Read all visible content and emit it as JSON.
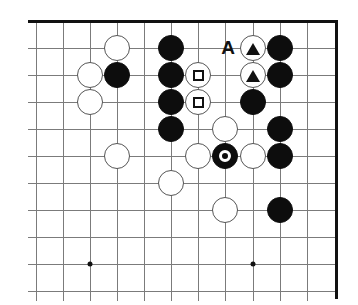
{
  "diagram": {
    "kind": "go-board-diagram",
    "board_region": "top-right corner",
    "columns": 11,
    "rows": 10,
    "cell_size_px": 27,
    "origin_x_px": 36,
    "origin_y_px": 21,
    "colors": {
      "background": "#ffffff",
      "grid_line": "#7b7b7b",
      "board_edge": "#111111",
      "black_stone": "#0d0d0d",
      "white_stone": "#ffffff",
      "white_stone_outline": "#555555",
      "marker": "#111111",
      "marker_on_black": "#ffffff"
    }
  },
  "edges": {
    "top": {
      "label": "top board edge",
      "y": 21,
      "x1": 28,
      "x2": 337
    },
    "right": {
      "label": "right board edge",
      "x": 335,
      "y1": 20,
      "y2": 299
    }
  },
  "grid": {
    "vertical_x": [
      36,
      63,
      90,
      117,
      144,
      171,
      198,
      225,
      253,
      280,
      307
    ],
    "horizontal_y": [
      21,
      48,
      75,
      102,
      129,
      156,
      183,
      210,
      237,
      264,
      291
    ]
  },
  "star_points": [
    {
      "name": "star-point-left",
      "x": 90,
      "y": 264
    },
    {
      "name": "star-point-right",
      "x": 253,
      "y": 264
    }
  ],
  "stones": [
    {
      "id": "w-c4-r2",
      "color": "white",
      "x": 117,
      "y": 48,
      "mark": null
    },
    {
      "id": "b-c6-r2",
      "color": "black",
      "x": 171,
      "y": 48,
      "mark": null
    },
    {
      "id": "w-c9-r2",
      "color": "white",
      "x": 253,
      "y": 48,
      "mark": "triangle"
    },
    {
      "id": "b-c10-r2",
      "color": "black",
      "x": 280,
      "y": 48,
      "mark": null
    },
    {
      "id": "w-c3-r3",
      "color": "white",
      "x": 90,
      "y": 75,
      "mark": null
    },
    {
      "id": "b-c4-r3",
      "color": "black",
      "x": 117,
      "y": 75,
      "mark": null
    },
    {
      "id": "b-c6-r3",
      "color": "black",
      "x": 171,
      "y": 75,
      "mark": null
    },
    {
      "id": "w-c7-r3",
      "color": "white",
      "x": 198,
      "y": 75,
      "mark": "square"
    },
    {
      "id": "w-c9-r3",
      "color": "white",
      "x": 253,
      "y": 75,
      "mark": "triangle"
    },
    {
      "id": "b-c10-r3",
      "color": "black",
      "x": 280,
      "y": 75,
      "mark": null
    },
    {
      "id": "w-c3-r4",
      "color": "white",
      "x": 90,
      "y": 102,
      "mark": null
    },
    {
      "id": "b-c6-r4",
      "color": "black",
      "x": 171,
      "y": 102,
      "mark": null
    },
    {
      "id": "w-c7-r4",
      "color": "white",
      "x": 198,
      "y": 102,
      "mark": "square"
    },
    {
      "id": "b-c9-r4",
      "color": "black",
      "x": 253,
      "y": 102,
      "mark": null
    },
    {
      "id": "b-c6-r5",
      "color": "black",
      "x": 171,
      "y": 129,
      "mark": null
    },
    {
      "id": "w-c8-r5",
      "color": "white",
      "x": 225,
      "y": 129,
      "mark": null
    },
    {
      "id": "b-c10-r5",
      "color": "black",
      "x": 280,
      "y": 129,
      "mark": null
    },
    {
      "id": "w-c4-r6",
      "color": "white",
      "x": 117,
      "y": 156,
      "mark": null
    },
    {
      "id": "w-c7-r6",
      "color": "white",
      "x": 198,
      "y": 156,
      "mark": null
    },
    {
      "id": "b-c8-r6",
      "color": "black",
      "x": 225,
      "y": 156,
      "mark": "circle"
    },
    {
      "id": "w-c9-r6",
      "color": "white",
      "x": 253,
      "y": 156,
      "mark": null
    },
    {
      "id": "b-c10-r6",
      "color": "black",
      "x": 280,
      "y": 156,
      "mark": null
    },
    {
      "id": "w-c6-r7",
      "color": "white",
      "x": 171,
      "y": 183,
      "mark": null
    },
    {
      "id": "w-c8-r8",
      "color": "white",
      "x": 225,
      "y": 210,
      "mark": null
    },
    {
      "id": "b-c10-r8",
      "color": "black",
      "x": 280,
      "y": 210,
      "mark": null
    }
  ],
  "labels": [
    {
      "id": "label-A",
      "text": "A",
      "x": 228,
      "y": 47
    }
  ]
}
